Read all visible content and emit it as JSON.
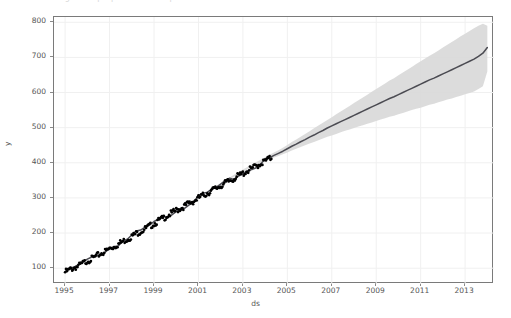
{
  "figure": {
    "clipped_title": "Figure  —  prophet forecast plot",
    "background": "#ffffff",
    "frame_color": "#7a7a7a",
    "grid_color": "#f0f0f0"
  },
  "chart_data": {
    "type": "line",
    "title": "",
    "xlabel": "ds",
    "ylabel": "y",
    "xlim": [
      1994.5,
      2014.3
    ],
    "ylim": [
      55,
      815
    ],
    "grid": true,
    "legend": false,
    "xticks": [
      1995,
      1997,
      1999,
      2001,
      2003,
      2005,
      2007,
      2009,
      2011,
      2013
    ],
    "xtick_labels": [
      "1995",
      "1997",
      "1999",
      "2001",
      "2003",
      "2005",
      "2007",
      "2009",
      "2011",
      "2013"
    ],
    "yticks": [
      100,
      200,
      300,
      400,
      500,
      600,
      700,
      800
    ],
    "ytick_labels": [
      "100",
      "200",
      "300",
      "400",
      "500",
      "600",
      "700",
      "800"
    ],
    "colors": {
      "observed_points": "#000000",
      "forecast_line": "#4b4b52",
      "uncertainty_band": "#d9d9d9"
    },
    "observed_end_x": 2004.3,
    "series": [
      {
        "name": "yhat",
        "kind": "line",
        "x": [
          1995.0,
          1995.2,
          1995.4,
          1995.6,
          1995.8,
          1996.0,
          1996.2,
          1996.4,
          1996.6,
          1996.8,
          1997.0,
          1997.2,
          1997.4,
          1997.6,
          1997.8,
          1998.0,
          1998.2,
          1998.4,
          1998.6,
          1998.8,
          1999.0,
          1999.2,
          1999.4,
          1999.6,
          1999.8,
          2000.0,
          2000.2,
          2000.4,
          2000.6,
          2000.8,
          2001.0,
          2001.2,
          2001.4,
          2001.6,
          2001.8,
          2002.0,
          2002.2,
          2002.4,
          2002.6,
          2002.8,
          2003.0,
          2003.2,
          2003.4,
          2003.6,
          2003.8,
          2004.0,
          2004.2,
          2004.4,
          2004.6,
          2004.8,
          2005.0,
          2005.2,
          2005.4,
          2005.6,
          2005.8,
          2006.0,
          2006.2,
          2006.4,
          2006.6,
          2006.8,
          2007.0,
          2007.2,
          2007.4,
          2007.6,
          2007.8,
          2008.0,
          2008.2,
          2008.4,
          2008.6,
          2008.8,
          2009.0,
          2009.2,
          2009.4,
          2009.6,
          2009.8,
          2010.0,
          2010.2,
          2010.4,
          2010.6,
          2010.8,
          2011.0,
          2011.2,
          2011.4,
          2011.6,
          2011.8,
          2012.0,
          2012.2,
          2012.4,
          2012.6,
          2012.8,
          2013.0,
          2013.2,
          2013.4,
          2013.6,
          2013.8,
          2014.0
        ],
        "y": [
          93,
          99,
          106,
          110,
          118,
          126,
          131,
          138,
          146,
          152,
          160,
          166,
          173,
          181,
          187,
          195,
          203,
          209,
          216,
          224,
          231,
          239,
          246,
          254,
          261,
          269,
          275,
          282,
          290,
          296,
          304,
          311,
          318,
          325,
          332,
          339,
          346,
          353,
          360,
          367,
          374,
          381,
          388,
          395,
          402,
          409,
          416,
          421,
          427,
          433,
          440,
          447,
          453,
          460,
          466,
          473,
          479,
          486,
          492,
          499,
          505,
          511,
          517,
          523,
          529,
          535,
          541,
          547,
          553,
          559,
          565,
          571,
          577,
          583,
          588,
          594,
          600,
          606,
          612,
          618,
          624,
          630,
          636,
          641,
          647,
          653,
          659,
          665,
          671,
          677,
          683,
          689,
          695,
          703,
          712,
          728
        ]
      },
      {
        "name": "yhat_lower",
        "kind": "band-lower",
        "y": [
          93,
          99,
          106,
          110,
          118,
          126,
          131,
          138,
          146,
          152,
          160,
          166,
          173,
          181,
          187,
          195,
          203,
          209,
          216,
          224,
          231,
          239,
          246,
          254,
          261,
          269,
          275,
          282,
          290,
          296,
          304,
          311,
          318,
          325,
          332,
          339,
          346,
          353,
          360,
          367,
          374,
          381,
          388,
          394,
          400,
          406,
          411,
          415,
          419,
          424,
          429,
          435,
          440,
          445,
          450,
          455,
          459,
          464,
          469,
          474,
          478,
          482,
          487,
          491,
          495,
          499,
          503,
          507,
          511,
          515,
          519,
          523,
          527,
          531,
          534,
          538,
          542,
          546,
          550,
          554,
          557,
          561,
          565,
          568,
          572,
          576,
          580,
          583,
          587,
          591,
          595,
          599,
          603,
          610,
          618,
          660
        ]
      },
      {
        "name": "yhat_upper",
        "kind": "band-upper",
        "y": [
          93,
          99,
          106,
          110,
          118,
          126,
          131,
          138,
          146,
          152,
          160,
          166,
          173,
          181,
          187,
          195,
          203,
          209,
          216,
          224,
          231,
          239,
          246,
          254,
          261,
          269,
          275,
          282,
          290,
          296,
          304,
          311,
          318,
          326,
          334,
          342,
          350,
          358,
          366,
          374,
          381,
          388,
          395,
          402,
          409,
          416,
          423,
          429,
          436,
          443,
          451,
          459,
          466,
          474,
          482,
          490,
          498,
          506,
          514,
          522,
          530,
          538,
          546,
          554,
          562,
          570,
          578,
          586,
          594,
          602,
          610,
          618,
          626,
          634,
          641,
          649,
          657,
          665,
          673,
          681,
          689,
          697,
          705,
          712,
          720,
          728,
          736,
          744,
          752,
          760,
          767,
          775,
          783,
          790,
          796,
          790
        ]
      }
    ]
  }
}
